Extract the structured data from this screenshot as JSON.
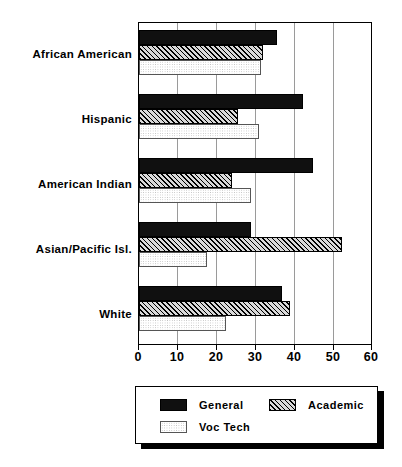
{
  "chart_data": {
    "type": "bar",
    "orientation": "horizontal",
    "title": "",
    "xlabel": "",
    "ylabel": "",
    "xlim": [
      0,
      60
    ],
    "xticks": [
      0,
      10,
      20,
      30,
      40,
      50,
      60
    ],
    "xtick_labels": [
      "0",
      "10",
      "20",
      "30",
      "40",
      "50",
      "60"
    ],
    "grid": true,
    "grid_axis": "x",
    "legend_position": "bottom",
    "categories": [
      "African American",
      "Hispanic",
      "American Indian",
      "Asian/Pacific Isl.",
      "White"
    ],
    "series": [
      {
        "name": "General",
        "fill": "solid-black",
        "color": "#101010",
        "values": [
          35.6,
          42.3,
          44.9,
          29.0,
          37.0
        ]
      },
      {
        "name": "Academic",
        "fill": "diagonal-hatch",
        "color": "#d8d8d8",
        "values": [
          32.0,
          25.6,
          24.0,
          52.5,
          39.0
        ]
      },
      {
        "name": "Voc Tech",
        "fill": "light-dots",
        "color": "#f2f2f2",
        "values": [
          31.5,
          31.0,
          29.0,
          17.5,
          22.5
        ]
      }
    ]
  },
  "legend": {
    "entries": [
      {
        "label": "General"
      },
      {
        "label": "Academic"
      },
      {
        "label": "Voc Tech"
      }
    ]
  }
}
